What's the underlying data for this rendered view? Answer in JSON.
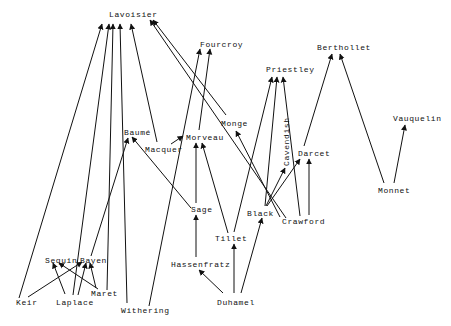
{
  "diagram": {
    "type": "directed-graph",
    "title": "",
    "nodes": [
      {
        "id": "lavoisier",
        "label": "Lavoisier",
        "x": 109,
        "y": 10
      },
      {
        "id": "fourcroy",
        "label": "Fourcroy",
        "x": 200,
        "y": 40
      },
      {
        "id": "priestley",
        "label": "Priestley",
        "x": 266,
        "y": 65
      },
      {
        "id": "berthollet",
        "label": "Berthollet",
        "x": 317,
        "y": 44
      },
      {
        "id": "vauquelin",
        "label": "Vauquelin",
        "x": 393,
        "y": 115
      },
      {
        "id": "baume",
        "label": "Baumé",
        "x": 124,
        "y": 129
      },
      {
        "id": "macquer",
        "label": "Macquer",
        "x": 145,
        "y": 146
      },
      {
        "id": "morveau",
        "label": "Morveau",
        "x": 186,
        "y": 133
      },
      {
        "id": "monge",
        "label": "Monge",
        "x": 221,
        "y": 119
      },
      {
        "id": "cavendish",
        "label": "Cavendish",
        "x": 282,
        "y": 166,
        "vertical": true
      },
      {
        "id": "darcet",
        "label": "Darcet",
        "x": 298,
        "y": 149
      },
      {
        "id": "monnet",
        "label": "Monnet",
        "x": 378,
        "y": 186
      },
      {
        "id": "sage",
        "label": "Sage",
        "x": 191,
        "y": 205
      },
      {
        "id": "black",
        "label": "Black",
        "x": 247,
        "y": 209
      },
      {
        "id": "crawford",
        "label": "Crawford",
        "x": 282,
        "y": 217
      },
      {
        "id": "tillet",
        "label": "Tillet",
        "x": 215,
        "y": 234
      },
      {
        "id": "hassenfratz",
        "label": "Hassenfratz",
        "x": 171,
        "y": 260
      },
      {
        "id": "sequin",
        "label": "Sequin",
        "x": 45,
        "y": 256
      },
      {
        "id": "bayen",
        "label": "Bayen",
        "x": 80,
        "y": 256
      },
      {
        "id": "maret",
        "label": "Maret",
        "x": 91,
        "y": 289
      },
      {
        "id": "keir",
        "label": "Keir",
        "x": 16,
        "y": 298
      },
      {
        "id": "laplace",
        "label": "Laplace",
        "x": 56,
        "y": 298
      },
      {
        "id": "withering",
        "label": "Withering",
        "x": 121,
        "y": 306
      },
      {
        "id": "duhamel",
        "label": "Duhamel",
        "x": 217,
        "y": 298
      }
    ],
    "edges": [
      {
        "from": "keir",
        "to": "lavoisier"
      },
      {
        "from": "keir",
        "to": "bayen"
      },
      {
        "from": "laplace",
        "to": "lavoisier"
      },
      {
        "from": "laplace",
        "to": "sequin"
      },
      {
        "from": "laplace",
        "to": "bayen"
      },
      {
        "from": "maret",
        "to": "lavoisier"
      },
      {
        "from": "maret",
        "to": "sequin"
      },
      {
        "from": "maret",
        "to": "bayen"
      },
      {
        "from": "bayen",
        "to": "baume"
      },
      {
        "from": "withering",
        "to": "lavoisier"
      },
      {
        "from": "withering",
        "to": "fourcroy"
      },
      {
        "from": "macquer",
        "to": "lavoisier"
      },
      {
        "from": "macquer",
        "to": "morveau"
      },
      {
        "from": "sage",
        "to": "baume"
      },
      {
        "from": "sage",
        "to": "morveau"
      },
      {
        "from": "morveau",
        "to": "fourcroy"
      },
      {
        "from": "monge",
        "to": "lavoisier"
      },
      {
        "from": "crawford",
        "to": "lavoisier"
      },
      {
        "from": "crawford",
        "to": "monge"
      },
      {
        "from": "crawford",
        "to": "priestley"
      },
      {
        "from": "crawford",
        "to": "darcet"
      },
      {
        "from": "black",
        "to": "priestley"
      },
      {
        "from": "black",
        "to": "cavendish"
      },
      {
        "from": "black",
        "to": "darcet"
      },
      {
        "from": "black",
        "to": "morveau"
      },
      {
        "from": "tillet",
        "to": "morveau"
      },
      {
        "from": "tillet",
        "to": "priestley"
      },
      {
        "from": "hassenfratz",
        "to": "sage"
      },
      {
        "from": "duhamel",
        "to": "hassenfratz"
      },
      {
        "from": "duhamel",
        "to": "tillet"
      },
      {
        "from": "duhamel",
        "to": "black"
      },
      {
        "from": "darcet",
        "to": "berthollet"
      },
      {
        "from": "monnet",
        "to": "berthollet"
      },
      {
        "from": "monnet",
        "to": "vauquelin"
      }
    ],
    "colors": {
      "line": "#111111",
      "text": "#111111",
      "background": "#ffffff"
    }
  },
  "labels": {
    "lavoisier": "Lavoisier",
    "fourcroy": "Fourcroy",
    "priestley": "Priestley",
    "berthollet": "Berthollet",
    "vauquelin": "Vauquelin",
    "baume": "Baumé",
    "macquer": "Macquer",
    "morveau": "Morveau",
    "monge": "Monge",
    "cavendish": "Cavendish",
    "darcet": "Darcet",
    "monnet": "Monnet",
    "sage": "Sage",
    "black": "Black",
    "crawford": "Crawford",
    "tillet": "Tillet",
    "hassenfratz": "Hassenfratz",
    "sequin": "Sequin",
    "bayen": "Bayen",
    "maret": "Maret",
    "keir": "Keir",
    "laplace": "Laplace",
    "withering": "Withering",
    "duhamel": "Duhamel"
  }
}
